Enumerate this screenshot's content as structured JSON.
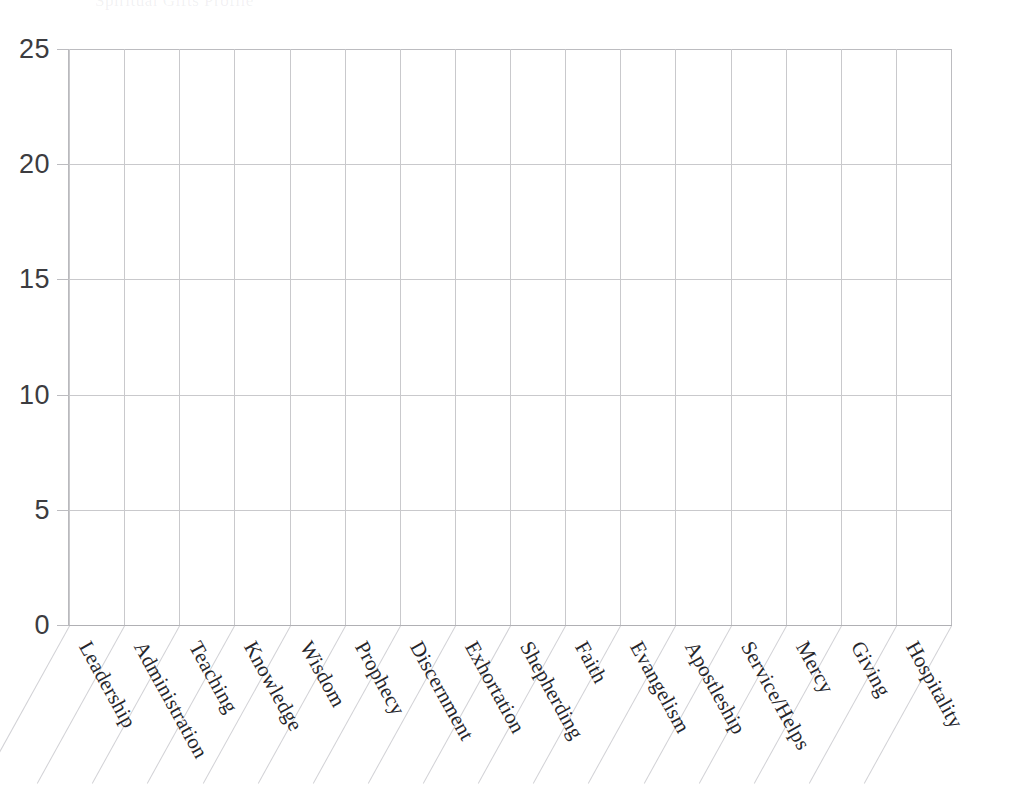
{
  "chart_data": {
    "type": "bar",
    "title": "",
    "xlabel": "",
    "ylabel": "",
    "categories": [
      "Leadership",
      "Administration",
      "Teaching",
      "Knowledge",
      "Wisdom",
      "Prophecy",
      "Discernment",
      "Exhortation",
      "Shepherding",
      "Faith",
      "Evangelism",
      "Apostleship",
      "Service/Helps",
      "Mercy",
      "Giving",
      "Hospitality"
    ],
    "values": [
      0,
      0,
      0,
      0,
      0,
      0,
      0,
      0,
      0,
      0,
      0,
      0,
      0,
      0,
      0,
      0
    ],
    "ylim": [
      0,
      25
    ],
    "ytick_labels": [
      "0",
      "5",
      "10",
      "15",
      "20",
      "25"
    ],
    "ytick_values": [
      0,
      5,
      10,
      15,
      20,
      25
    ],
    "grid": true,
    "legend": null,
    "note": "Empty grid chart with no plotted bars"
  },
  "axes": {
    "y_ticks": [
      "25",
      "20",
      "15",
      "10",
      "5",
      "0"
    ]
  },
  "header": {
    "title_remnant": "Spiritual Gifts Profile"
  },
  "colors": {
    "grid": "#c9c9cc",
    "axis": "#b0b0b4",
    "tick_text": "#3c3c40",
    "category_text": "#26262b",
    "background": "#ffffff"
  }
}
